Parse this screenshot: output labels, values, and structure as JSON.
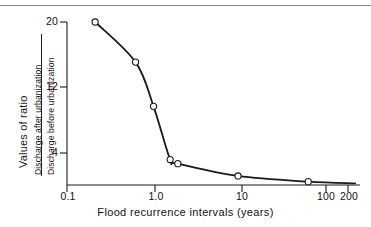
{
  "figure": {
    "top_rule": true,
    "background_color": "#ffffff",
    "line_color": "#1a1a1a",
    "marker_fill": "#ffffff",
    "marker_stroke": "#1a1a1a"
  },
  "axis": {
    "x_title": "Flood recurrence intervals (years)",
    "y_title_left": "Values of ratio",
    "y_title_numerator": "Discharge after urbanization",
    "y_title_denominator": "Discharge before urbanization",
    "x_tick_labels": [
      "0.1",
      "1.0",
      "10",
      "100",
      "200"
    ],
    "y_tick_labels": [
      "20",
      "12",
      "4"
    ]
  },
  "chart_data": {
    "type": "line",
    "title": "",
    "subtitle": "",
    "xlabel": "Flood recurrence intervals (years)",
    "ylabel": "Values of ratio: Discharge after urbanization / Discharge before urbanization",
    "xscale": "log",
    "yscale": "linear",
    "xlim": [
      0.1,
      200
    ],
    "ylim": [
      0,
      20
    ],
    "xticks": [
      0.1,
      1.0,
      10,
      100,
      200
    ],
    "xticklabels": [
      "0.1",
      "1.0",
      "10",
      "100",
      "200"
    ],
    "yticks": [
      4,
      12,
      20
    ],
    "yticklabels": [
      "4",
      "12",
      "20"
    ],
    "grid": false,
    "legend": false,
    "marker": "open-circle",
    "series": [
      {
        "name": "Urbanization discharge ratio",
        "x": [
          0.21,
          0.61,
          0.98,
          1.52,
          1.86,
          9.1,
          58.0
        ],
        "y": [
          20.0,
          15.1,
          9.7,
          3.2,
          2.7,
          1.2,
          0.5
        ]
      }
    ],
    "annotations": []
  }
}
